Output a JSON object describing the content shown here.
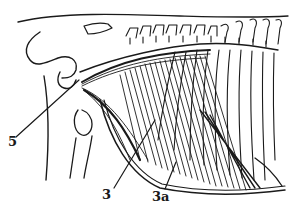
{
  "figure": {
    "stroke_color": "#1a1a1a",
    "background_color": "#ffffff"
  },
  "labels": [
    {
      "id": "5",
      "text": "5",
      "x": 8,
      "y": 141,
      "leader": {
        "x1": 16,
        "y1": 137,
        "x2": 79,
        "y2": 80
      }
    },
    {
      "id": "3",
      "text": "3",
      "x": 101,
      "y": 193,
      "leader": {
        "x1": 114,
        "y1": 188,
        "x2": 155,
        "y2": 120
      }
    },
    {
      "id": "3a",
      "text": "3a",
      "x": 152,
      "y": 195,
      "leader": {
        "x1": 165,
        "y1": 189,
        "x2": 176,
        "y2": 162
      }
    }
  ]
}
